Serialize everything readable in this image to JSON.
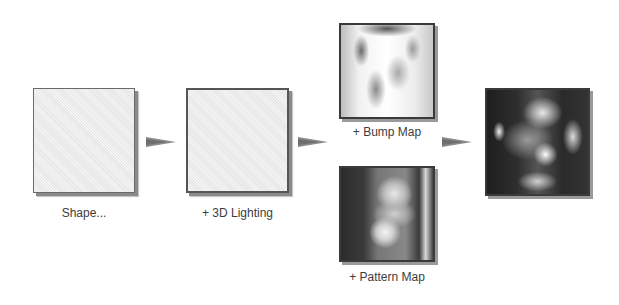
{
  "diagram": {
    "steps": [
      {
        "id": "shape",
        "label": "Shape..."
      },
      {
        "id": "lighting",
        "label": "+ 3D Lighting"
      },
      {
        "id": "bump",
        "label": "+ Bump Map"
      },
      {
        "id": "pattern",
        "label": "+ Pattern Map"
      },
      {
        "id": "result",
        "label": ""
      }
    ],
    "edges": [
      {
        "from": "shape",
        "to": "lighting"
      },
      {
        "from": "lighting",
        "to": "bump"
      },
      {
        "from": "bump",
        "to": "result"
      }
    ]
  }
}
